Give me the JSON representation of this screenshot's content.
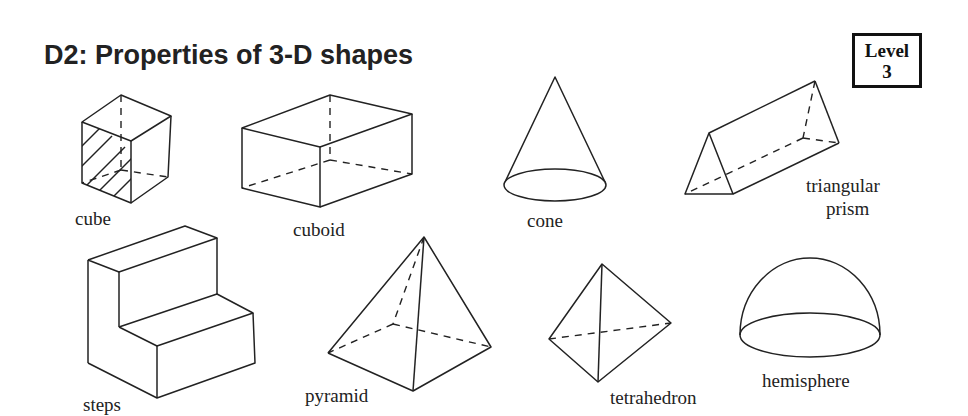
{
  "header": {
    "title": "D2: Properties of 3-D shapes",
    "level_label": "Level",
    "level_number": "3"
  },
  "shapes": [
    {
      "name": "cube",
      "label": "cube"
    },
    {
      "name": "cuboid",
      "label": "cuboid"
    },
    {
      "name": "cone",
      "label": "cone"
    },
    {
      "name": "triangular-prism",
      "label_line1": "triangular",
      "label_line2": "prism"
    },
    {
      "name": "steps",
      "label": "steps"
    },
    {
      "name": "pyramid",
      "label": "pyramid"
    },
    {
      "name": "tetrahedron",
      "label": "tetrahedron"
    },
    {
      "name": "hemisphere",
      "label": "hemisphere"
    }
  ]
}
